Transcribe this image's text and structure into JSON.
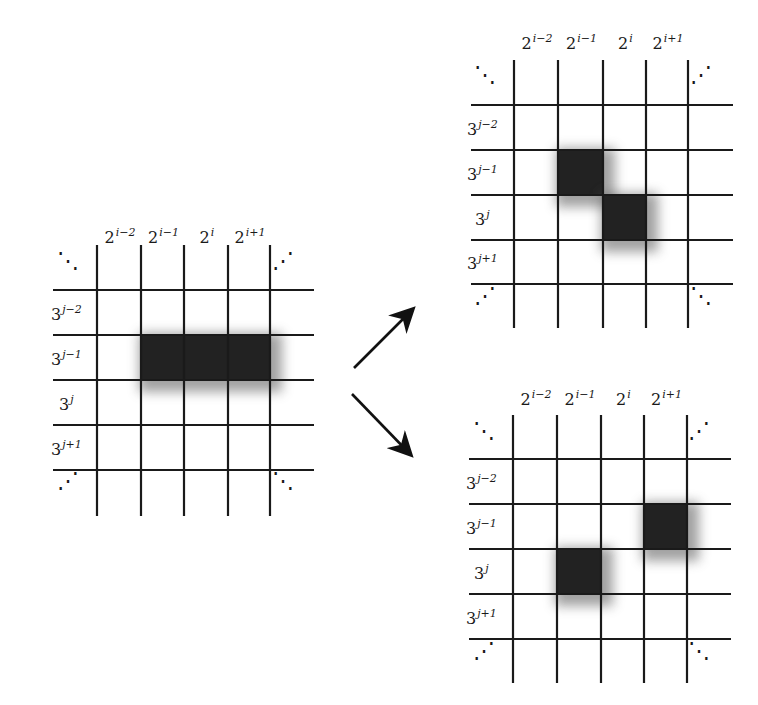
{
  "figure": {
    "colors": {
      "grid_line": "#1a1a1a",
      "block": "#222222",
      "background": "#ffffff"
    }
  },
  "grids": [
    {
      "id": "left",
      "column_labels": [
        {
          "base": "2",
          "exp": "i−2"
        },
        {
          "base": "2",
          "exp": "i−1"
        },
        {
          "base": "2",
          "exp": "i"
        },
        {
          "base": "2",
          "exp": "i+1"
        }
      ],
      "row_labels": [
        {
          "base": "3",
          "exp": "j−2"
        },
        {
          "base": "3",
          "exp": "j−1"
        },
        {
          "base": "3",
          "exp": "j"
        },
        {
          "base": "3",
          "exp": "j+1"
        }
      ],
      "corner_ellipses": [
        "⋱",
        "⋰",
        "⋰",
        "⋱"
      ],
      "blocks": [
        {
          "col_start": 1,
          "col_end": 3,
          "row": 1
        }
      ]
    },
    {
      "id": "top-right",
      "column_labels": [
        {
          "base": "2",
          "exp": "i−2"
        },
        {
          "base": "2",
          "exp": "i−1"
        },
        {
          "base": "2",
          "exp": "i"
        },
        {
          "base": "2",
          "exp": "i+1"
        }
      ],
      "row_labels": [
        {
          "base": "3",
          "exp": "j−2"
        },
        {
          "base": "3",
          "exp": "j−1"
        },
        {
          "base": "3",
          "exp": "j"
        },
        {
          "base": "3",
          "exp": "j+1"
        }
      ],
      "corner_ellipses": [
        "⋱",
        "⋰",
        "⋰",
        "⋱"
      ],
      "blocks": [
        {
          "col_start": 1,
          "col_end": 1,
          "row": 1
        },
        {
          "col_start": 2,
          "col_end": 2,
          "row": 2
        }
      ]
    },
    {
      "id": "bottom-right",
      "column_labels": [
        {
          "base": "2",
          "exp": "i−2"
        },
        {
          "base": "2",
          "exp": "i−1"
        },
        {
          "base": "2",
          "exp": "i"
        },
        {
          "base": "2",
          "exp": "i+1"
        }
      ],
      "row_labels": [
        {
          "base": "3",
          "exp": "j−2"
        },
        {
          "base": "3",
          "exp": "j−1"
        },
        {
          "base": "3",
          "exp": "j"
        },
        {
          "base": "3",
          "exp": "j+1"
        }
      ],
      "corner_ellipses": [
        "⋱",
        "⋰",
        "⋰",
        "⋱"
      ],
      "blocks": [
        {
          "col_start": 1,
          "col_end": 1,
          "row": 2
        },
        {
          "col_start": 3,
          "col_end": 3,
          "row": 1
        }
      ]
    }
  ],
  "arrows": [
    {
      "id": "arrow-up",
      "label": "to top-right grid"
    },
    {
      "id": "arrow-down",
      "label": "to bottom-right grid"
    }
  ]
}
